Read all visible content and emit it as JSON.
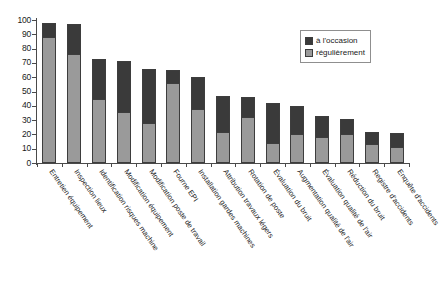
{
  "chart_data": {
    "type": "bar",
    "subtype": "stacked-vertical",
    "title": "",
    "xlabel": "",
    "ylabel": "",
    "ylim": [
      0,
      100
    ],
    "yticks": [
      0,
      10,
      20,
      30,
      40,
      50,
      60,
      70,
      80,
      90,
      100
    ],
    "grid": false,
    "legend_position": "top-right",
    "categories": [
      "Entretien équipement",
      "Inspection lieux",
      "Identification risques machine",
      "Modification équipement",
      "Modification poste de travail",
      "Fourne EPI",
      "Installation gardes machines",
      "Attribution travaux légers",
      "Rotation de poste",
      "Évaluation du bruit",
      "Augmentation qualité de l'air",
      "Évaluation qualité de l'air",
      "Réduction du bruit",
      "Registre d'accidents",
      "Enquête d'accidents"
    ],
    "series": [
      {
        "name": "régulièrement",
        "color": "#9a9a9a",
        "values": [
          88,
          76,
          45,
          36,
          28,
          56,
          38,
          22,
          32,
          14,
          20,
          18,
          20,
          13,
          11
        ]
      },
      {
        "name": "à l'occasion",
        "color": "#3a3a3a",
        "values": [
          10,
          21,
          28,
          35,
          38,
          9,
          22,
          25,
          14,
          28,
          20,
          15,
          11,
          9,
          10
        ]
      }
    ],
    "totals": [
      98,
      97,
      73,
      71,
      66,
      65,
      60,
      47,
      46,
      42,
      40,
      33,
      31,
      22,
      21
    ]
  },
  "legend": {
    "items": [
      {
        "label": "à l'occasion",
        "swatch": "dark"
      },
      {
        "label": "régulièrement",
        "swatch": "light"
      }
    ]
  },
  "colors": {
    "series_dark": "#3a3a3a",
    "series_light": "#9a9a9a",
    "axis": "#4a4a4a",
    "background": "#ffffff"
  }
}
